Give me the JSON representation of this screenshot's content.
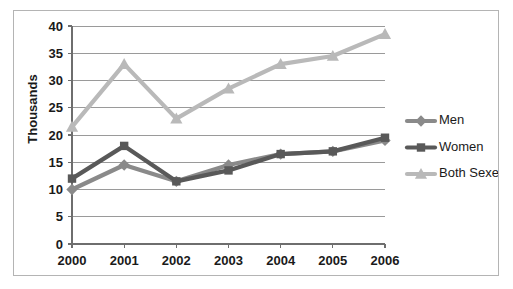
{
  "chart_data": {
    "type": "line",
    "title": "",
    "xlabel": "",
    "ylabel": "Thousands",
    "categories": [
      "2000",
      "2001",
      "2002",
      "2003",
      "2004",
      "2005",
      "2006"
    ],
    "x": [
      2000,
      2001,
      2002,
      2003,
      2004,
      2005,
      2006
    ],
    "ylim": [
      0,
      40
    ],
    "yticks": [
      0,
      5,
      10,
      15,
      20,
      25,
      30,
      35,
      40
    ],
    "ytick_labels": [
      "0",
      "5",
      "10",
      "15",
      "20",
      "25",
      "30",
      "35",
      "40"
    ],
    "grid": true,
    "legend_position": "right",
    "series": [
      {
        "name": "Men",
        "marker": "diamond",
        "color": "#8a8a8a",
        "values": [
          10,
          14.5,
          11.5,
          14.5,
          16.5,
          17,
          19
        ]
      },
      {
        "name": "Women",
        "marker": "square",
        "color": "#595959",
        "values": [
          12,
          18,
          11.5,
          13.5,
          16.5,
          17,
          19.5
        ]
      },
      {
        "name": "Both Sexes",
        "marker": "triangle",
        "color": "#b9b9b9",
        "values": [
          21.5,
          33,
          23,
          28.5,
          33,
          34.5,
          38.5
        ]
      }
    ]
  },
  "legend": {
    "items": [
      {
        "label": "Men"
      },
      {
        "label": "Women"
      },
      {
        "label": "Both Sexes"
      }
    ]
  },
  "colors": {
    "men": "#8a8a8a",
    "women": "#595959",
    "both_sexes": "#b9b9b9",
    "gridline": "#9a9a9a",
    "axis": "#6e6e6e",
    "frame_border": "#b4b4b4",
    "text": "#1a1a1a",
    "background": "#ffffff"
  }
}
